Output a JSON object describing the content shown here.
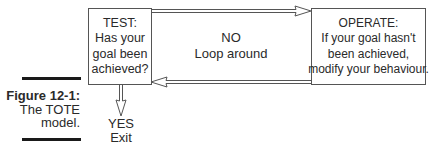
{
  "figure": {
    "label": "Figure 12-1:",
    "caption_line1": "The TOTE",
    "caption_line2": "model."
  },
  "test_box": {
    "line1": "TEST:",
    "line2": "Has your",
    "line3": "goal been",
    "line4": "achieved?"
  },
  "loop": {
    "line1": "NO",
    "line2": "Loop around"
  },
  "operate_box": {
    "line1": "OPERATE:",
    "line2": "If your goal hasn't",
    "line3": "been achieved,",
    "line4": "modify your behaviour."
  },
  "exit": {
    "line1": "YES",
    "line2": "Exit"
  },
  "colors": {
    "border": "#555555",
    "text": "#2a2a2a",
    "bar": "#1a1a1a"
  }
}
